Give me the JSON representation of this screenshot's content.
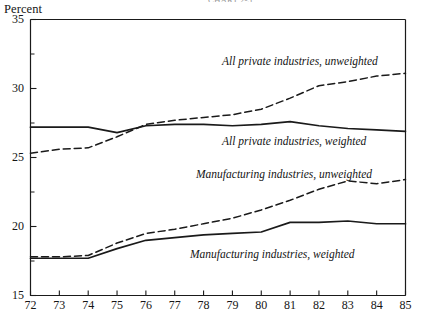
{
  "header": {
    "cut_off_title": "CHART 2-5"
  },
  "axis": {
    "y_title": "Percent",
    "y_ticks": [
      15,
      20,
      25,
      30,
      35
    ],
    "y_minor_ticks": [
      17.5,
      22.5,
      27.5,
      32.5
    ],
    "x_ticks": [
      "72",
      "73",
      "74",
      "75",
      "76",
      "77",
      "78",
      "79",
      "80",
      "81",
      "82",
      "83",
      "84",
      "85"
    ]
  },
  "colors": {
    "line": "#1a1a1a",
    "axis": "#1a1a1a",
    "background": "#ffffff"
  },
  "series_labels": [
    "All private industries, unweighted",
    "All private industries, weighted",
    "Manufacturing industries, unweighted",
    "Manufacturing industries, weighted"
  ],
  "chart_data": {
    "type": "line",
    "title": "",
    "xlabel": "",
    "ylabel": "Percent",
    "xlim": [
      72,
      85
    ],
    "ylim": [
      15,
      35
    ],
    "grid": false,
    "legend": "inline-annotations",
    "x": [
      72,
      73,
      74,
      75,
      76,
      77,
      78,
      79,
      80,
      81,
      82,
      83,
      84,
      85
    ],
    "series": [
      {
        "name": "All private industries, unweighted",
        "style": "dashed",
        "values": [
          25.3,
          25.6,
          25.7,
          26.5,
          27.4,
          27.7,
          27.9,
          28.1,
          28.5,
          29.3,
          30.2,
          30.5,
          30.9,
          31.1
        ]
      },
      {
        "name": "All private industries, weighted",
        "style": "solid",
        "values": [
          27.2,
          27.2,
          27.2,
          26.8,
          27.3,
          27.4,
          27.4,
          27.3,
          27.4,
          27.6,
          27.3,
          27.1,
          27.0,
          26.9
        ]
      },
      {
        "name": "Manufacturing industries, unweighted",
        "style": "dashed",
        "values": [
          17.8,
          17.8,
          17.9,
          18.8,
          19.5,
          19.8,
          20.2,
          20.6,
          21.2,
          21.9,
          22.7,
          23.3,
          23.1,
          23.4
        ]
      },
      {
        "name": "Manufacturing industries, weighted",
        "style": "solid",
        "values": [
          17.7,
          17.7,
          17.7,
          18.4,
          19.0,
          19.2,
          19.4,
          19.5,
          19.6,
          20.3,
          20.3,
          20.4,
          20.2,
          20.2
        ]
      }
    ]
  },
  "annotations": [
    {
      "text": "All private industries, unweighted",
      "x": 222,
      "y": 55
    },
    {
      "text": "All private industries, weighted",
      "x": 222,
      "y": 135
    },
    {
      "text": "Manufacturing industries, unweighted",
      "x": 196,
      "y": 168
    },
    {
      "text": "Manufacturing industries, weighted",
      "x": 190,
      "y": 248
    }
  ]
}
